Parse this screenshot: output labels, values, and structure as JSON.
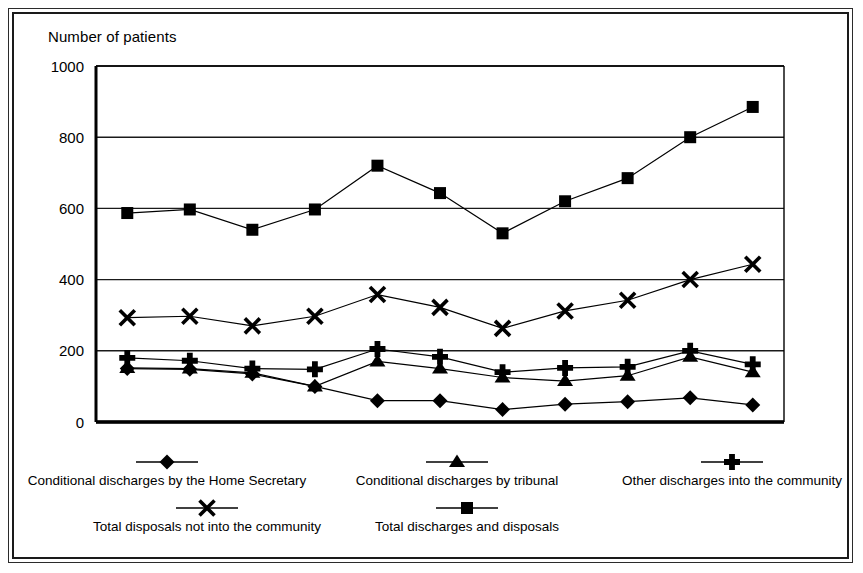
{
  "axis_title": "Number of patients",
  "chart_data": {
    "type": "line",
    "title": "",
    "xlabel": "",
    "ylabel": "Number of patients",
    "ylim": [
      0,
      1000
    ],
    "yticks": [
      0,
      200,
      400,
      600,
      800,
      1000
    ],
    "grid": true,
    "legend_position": "bottom",
    "categories": [
      "1980",
      "1981",
      "1982",
      "1983",
      "1984",
      "1985",
      "1986",
      "1987",
      "1988",
      "1989",
      "1990"
    ],
    "series": [
      {
        "name": "Conditional discharges by the Home Secretary",
        "marker": "diamond",
        "values": [
          150,
          148,
          135,
          100,
          60,
          60,
          35,
          50,
          57,
          68,
          48
        ]
      },
      {
        "name": "Conditional discharges by tribunal",
        "marker": "triangle",
        "values": [
          152,
          150,
          138,
          100,
          170,
          150,
          125,
          115,
          130,
          183,
          140
        ]
      },
      {
        "name": "Other discharges into the community",
        "marker": "plus",
        "values": [
          180,
          172,
          150,
          148,
          205,
          183,
          140,
          152,
          155,
          200,
          162
        ]
      },
      {
        "name": "Total disposals not into the community",
        "marker": "cross",
        "values": [
          293,
          297,
          270,
          297,
          358,
          322,
          263,
          312,
          342,
          400,
          443
        ]
      },
      {
        "name": "Total discharges and disposals",
        "marker": "square",
        "values": [
          587,
          597,
          540,
          597,
          720,
          643,
          530,
          620,
          685,
          800,
          885
        ]
      }
    ]
  },
  "legend": {
    "items": [
      {
        "label": "Conditional discharges by the Home Secretary",
        "marker": "diamond"
      },
      {
        "label": "Conditional discharges by tribunal",
        "marker": "triangle"
      },
      {
        "label": "Other discharges into the community",
        "marker": "plus"
      },
      {
        "label": "Total disposals not into the community",
        "marker": "cross"
      },
      {
        "label": "Total discharges and disposals",
        "marker": "square"
      }
    ]
  },
  "colors": {
    "ink": "#000000",
    "background": "#ffffff",
    "grid": "#1a1a1a",
    "frame": "#1a1a1a"
  }
}
